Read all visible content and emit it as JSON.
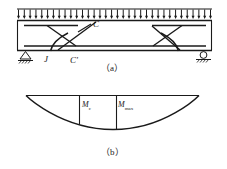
{
  "figure": {
    "panels": [
      {
        "id": "a",
        "caption": "（a）",
        "description": "simply-supported-beam-with-uniform-load",
        "labels": [
          {
            "id": "C",
            "text": "C",
            "kind": "strut-node-upper"
          },
          {
            "id": "J",
            "text": "J",
            "kind": "support-node"
          },
          {
            "id": "Cp",
            "text": "C'",
            "kind": "strut-node-lower"
          }
        ],
        "load": {
          "name": "uniformly-distributed-load",
          "arrow_count": 34,
          "direction": "down"
        },
        "supports": [
          {
            "id": "left",
            "type": "pinned-support"
          },
          {
            "id": "right",
            "type": "roller-support"
          }
        ]
      },
      {
        "id": "b",
        "caption": "（b）",
        "description": "bending-moment-diagram",
        "labels": [
          {
            "id": "Mc",
            "base": "M",
            "subscript": "c",
            "kind": "moment-ordinate"
          },
          {
            "id": "Mmax",
            "base": "M",
            "subscript": "max",
            "kind": "moment-ordinate"
          }
        ]
      }
    ],
    "colors": {
      "line": "#1a1a1a",
      "background": "#ffffff",
      "hatch": "#1a1a1a"
    }
  }
}
